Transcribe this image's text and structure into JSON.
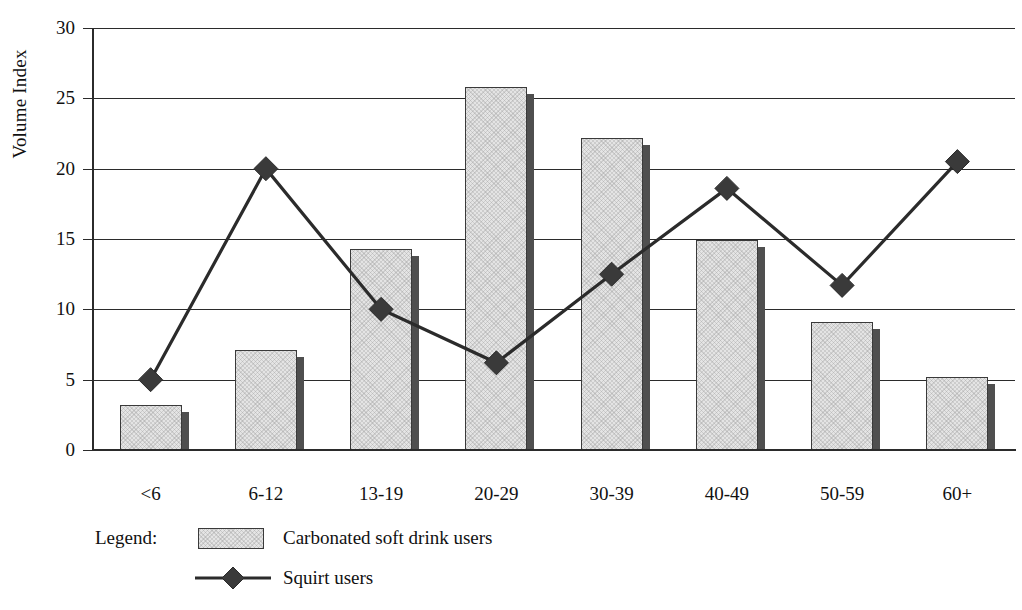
{
  "chart_data": {
    "type": "bar",
    "title": "",
    "xlabel": "Age",
    "ylabel": "Volume Index",
    "categories": [
      "<6",
      "6-12",
      "13-19",
      "20-29",
      "30-39",
      "40-49",
      "50-59",
      "60+"
    ],
    "ylim": [
      0,
      30
    ],
    "yticks": [
      0,
      5,
      10,
      15,
      20,
      25,
      30
    ],
    "ytick_labels": [
      "0",
      "5",
      "10",
      "15",
      "20",
      "25",
      "30"
    ],
    "grid": true,
    "legend_position": "below-left",
    "series": [
      {
        "name": "Carbonated soft drink users",
        "kind": "bar",
        "values": [
          3.2,
          7.1,
          14.3,
          25.8,
          22.2,
          14.9,
          9.1,
          5.2
        ]
      },
      {
        "name": "Squirt users",
        "kind": "line",
        "marker": "diamond",
        "values": [
          5.0,
          20.0,
          10.0,
          6.2,
          12.5,
          18.6,
          11.7,
          20.5
        ]
      }
    ]
  },
  "legend": {
    "title": "Legend:",
    "entries": [
      {
        "label": "Carbonated soft drink users",
        "symbol": "filled-rectangle-swatch"
      },
      {
        "label": "Squirt users",
        "symbol": "line-with-diamond-marker"
      }
    ]
  },
  "colors": {
    "bar_fill": "#e4e4e4",
    "bar_outline": "#3a3a3a",
    "bar_shadow": "#4f4f4f",
    "line": "#2b2b2b",
    "marker": "#3a3a3a",
    "axis": "#2b2b2b",
    "background": "#ffffff",
    "text": "#111111"
  }
}
